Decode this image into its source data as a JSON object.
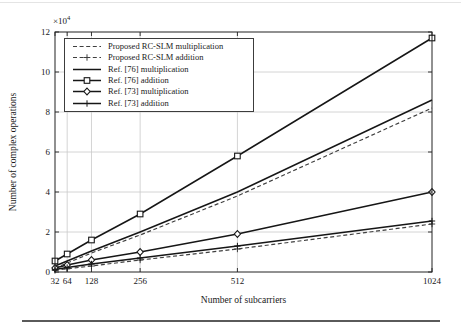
{
  "chart_data": {
    "type": "line",
    "title": "",
    "xlabel": "Number of subcarriers",
    "ylabel": "Number of complex operations",
    "y_unit_base": "×10",
    "y_unit_exp": "4",
    "x": [
      32,
      64,
      128,
      256,
      512,
      1024
    ],
    "x_tick_labels": [
      "32",
      "64",
      "128",
      "256",
      "512",
      "1024"
    ],
    "y_ticks": [
      0,
      2,
      4,
      6,
      8,
      10,
      12
    ],
    "y_tick_unit": 10000,
    "ylim": [
      0,
      120000
    ],
    "xlim": [
      32,
      1024
    ],
    "x_scale": "linear",
    "grid": true,
    "grid_color": "#c9c9c9",
    "axis_color": "#222222",
    "legend_position": "upper-left",
    "series": [
      {
        "name": "Proposed RC-SLM multiplication",
        "style": "dashed",
        "marker": "none",
        "color": "#3f3f3f",
        "values": [
          2000,
          4500,
          9500,
          18500,
          38000,
          82000
        ]
      },
      {
        "name": "Proposed RC-SLM addition",
        "style": "dashed",
        "marker": "plus",
        "color": "#3f3f3f",
        "values": [
          800,
          1600,
          3000,
          6000,
          11500,
          24000
        ]
      },
      {
        "name": "Ref. [76] multiplication",
        "style": "solid",
        "marker": "none",
        "color": "#161616",
        "values": [
          3000,
          5500,
          10500,
          20000,
          40000,
          86000
        ]
      },
      {
        "name": "Ref. [76] addition",
        "style": "solid",
        "marker": "square",
        "color": "#161616",
        "values": [
          5500,
          9000,
          16000,
          29000,
          58000,
          117000
        ]
      },
      {
        "name": "Ref. [73] multiplication",
        "style": "solid",
        "marker": "diamond",
        "color": "#161616",
        "values": [
          2000,
          3500,
          6000,
          10000,
          19000,
          40000
        ]
      },
      {
        "name": "Ref. [73] addition",
        "style": "solid",
        "marker": "plus",
        "color": "#161616",
        "values": [
          1200,
          2200,
          4000,
          7000,
          13000,
          25500
        ]
      }
    ]
  }
}
